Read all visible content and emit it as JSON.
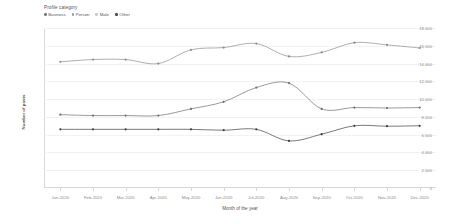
{
  "legend": {
    "title": "Profile category",
    "items": [
      {
        "label": "Business",
        "color": "#7b7b7b"
      },
      {
        "label": "Person",
        "color": "#9a9a9a"
      },
      {
        "label": "Male",
        "color": "#c9c9c9"
      },
      {
        "label": "Other",
        "color": "#4a4a4a"
      }
    ]
  },
  "chart_data": {
    "type": "line",
    "title": "",
    "xlabel": "Month of the year",
    "ylabel": "Number of posts",
    "grid": true,
    "legend_position": "top-left",
    "ylim": [
      0,
      18000
    ],
    "yticks": [
      18000,
      16000,
      14000,
      12000,
      10000,
      8000,
      6000,
      4000,
      2000,
      0
    ],
    "ytick_labels": [
      "18 000",
      "16 000",
      "14 000",
      "12 000",
      "10 000",
      "8 000",
      "6 000",
      "4 000",
      "2 000",
      "0"
    ],
    "categories": [
      "Jan-2020",
      "Feb-2020",
      "Mar-2020",
      "Apr-2020",
      "May-2020",
      "Jun-2020",
      "Jul-2020",
      "Aug-2020",
      "Sep-2020",
      "Oct-2020",
      "Nov-2020",
      "Dec-2020"
    ],
    "series": [
      {
        "name": "Other",
        "color": "#8d8d8d",
        "values": [
          14200,
          14450,
          14450,
          14000,
          15550,
          15800,
          16250,
          14800,
          15250,
          16350,
          16100,
          15750
        ]
      },
      {
        "name": "Business",
        "color": "#6f6f6f",
        "values": [
          8250,
          8150,
          8150,
          8150,
          8900,
          9700,
          11300,
          11800,
          8900,
          9050,
          9000,
          9050
        ]
      },
      {
        "name": "Person",
        "color": "#3f3f3f",
        "values": [
          6600,
          6600,
          6600,
          6600,
          6600,
          6500,
          6600,
          5300,
          6050,
          7000,
          6950,
          7000
        ]
      }
    ]
  }
}
